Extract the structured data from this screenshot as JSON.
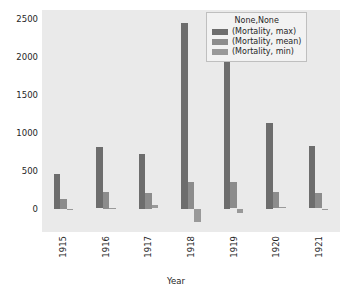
{
  "chart_data": {
    "type": "bar",
    "title": "",
    "xlabel": "Year",
    "ylabel": "",
    "categories": [
      "1915",
      "1916",
      "1917",
      "1918",
      "1919",
      "1920",
      "1921"
    ],
    "series": [
      {
        "name": "(Mortality, max)",
        "values": [
          450,
          810,
          715,
          2450,
          2160,
          1125,
          830
        ],
        "color": "#6d6d6d"
      },
      {
        "name": "(Mortality, mean)",
        "values": [
          130,
          215,
          205,
          355,
          345,
          220,
          200
        ],
        "color": "#8c8c8c"
      },
      {
        "name": "(Mortality, min)",
        "values": [
          -10,
          12,
          40,
          -175,
          -60,
          20,
          -18
        ],
        "color": "#999999"
      }
    ],
    "legend_title": "None,None",
    "legend_position": "upper right",
    "yticks": [
      0,
      500,
      1000,
      1500,
      2000,
      2500
    ],
    "ylim": [
      -310,
      2620
    ],
    "grid": false,
    "xtick_rotation": 90,
    "axes_facecolor": "#eaeaea",
    "figure_facecolor": "#ffffff"
  }
}
